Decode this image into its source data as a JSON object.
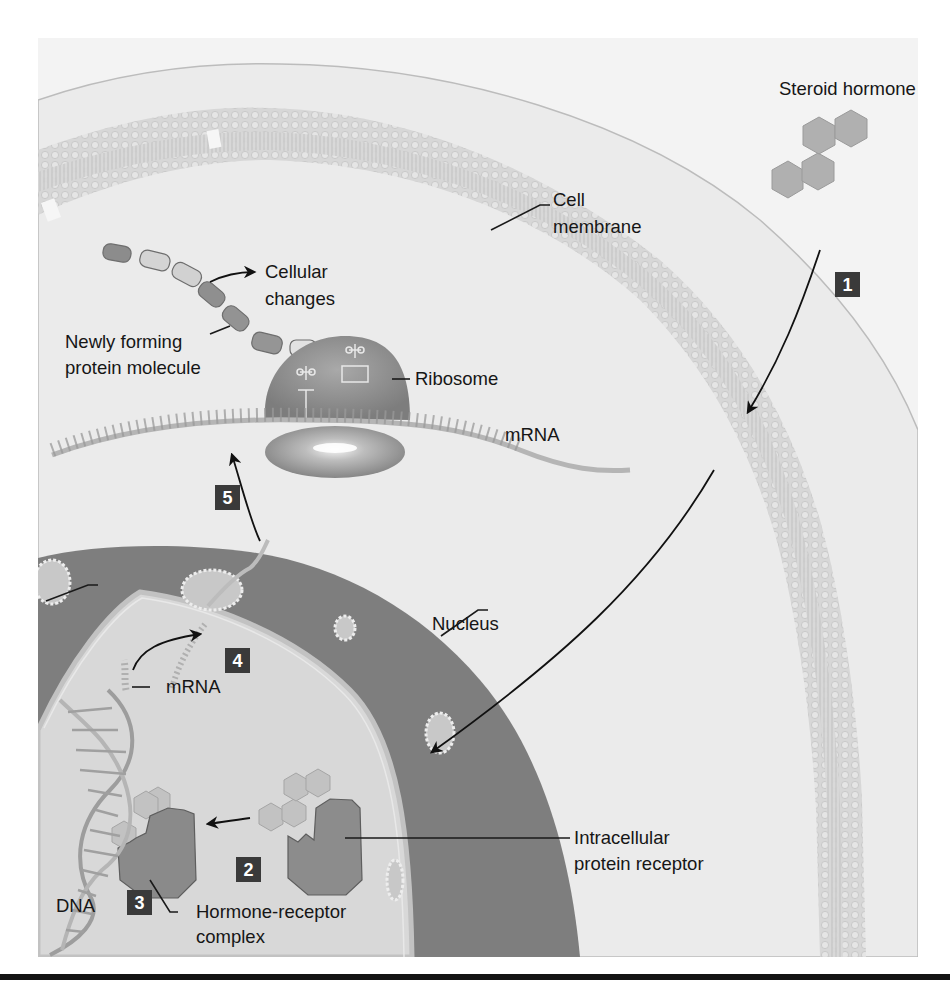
{
  "figure": {
    "colors": {
      "frame_background": "#e9e9e9",
      "outside_cell": "#f4f4f4",
      "cytoplasm": "#ebebeb",
      "membrane": "#cfcfcf",
      "nuclear_envelope": "#7a7a7a",
      "nucleoplasm": "#d9d9d9",
      "receptor": "#8a8a8a",
      "hormone": "#b3b3b3",
      "step_box": "#3a3a3a",
      "text": "#161616"
    },
    "labels": {
      "steroid_hormone": "Steroid hormone",
      "cell_membrane_line1": "Cell",
      "cell_membrane_line2": "membrane",
      "cellular_changes_line1": "Cellular",
      "cellular_changes_line2": "changes",
      "newly_forming_line1": "Newly forming",
      "newly_forming_line2": "protein molecule",
      "ribosome": "Ribosome",
      "mrna_cytoplasm": "mRNA",
      "nucleus": "Nucleus",
      "mrna_nucleus": "mRNA",
      "intracellular_line1": "Intracellular",
      "intracellular_line2": "protein receptor",
      "dna": "DNA",
      "hormone_receptor_line1": "Hormone-receptor",
      "hormone_receptor_line2": "complex"
    },
    "steps": [
      {
        "number": "1",
        "description": "Steroid hormone diffuses through cell membrane"
      },
      {
        "number": "2",
        "description": "Hormone binds intracellular protein receptor"
      },
      {
        "number": "3",
        "description": "Hormone-receptor complex binds DNA"
      },
      {
        "number": "4",
        "description": "mRNA transcribed and leaves nucleus"
      },
      {
        "number": "5",
        "description": "mRNA translated at ribosome"
      }
    ]
  }
}
